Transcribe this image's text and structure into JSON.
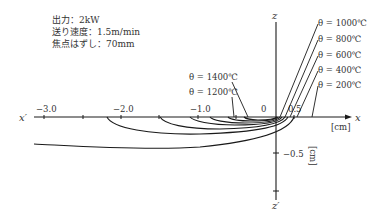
{
  "conditions": {
    "power": "出力：2kW",
    "feed_speed": "送り速度：1.5m/min",
    "defocus": "焦点はずし：70mm"
  },
  "axes": {
    "x_pos_label": "x",
    "x_neg_label": "x′",
    "z_pos_label": "z",
    "z_neg_label": "z′",
    "x_unit": "[cm]",
    "z_unit": "[cm]",
    "x_ticks": [
      "−3.0",
      "−2.0",
      "−1.0",
      "0",
      "0.5"
    ],
    "z_ticks": [
      "−0.5"
    ]
  },
  "isotherms": [
    {
      "label": "θ = 1400℃",
      "theta": 1400
    },
    {
      "label": "θ = 1200℃",
      "theta": 1200
    },
    {
      "label": "θ = 1000℃",
      "theta": 1000
    },
    {
      "label": "θ = 800℃",
      "theta": 800
    },
    {
      "label": "θ = 600℃",
      "theta": 600
    },
    {
      "label": "θ = 400℃",
      "theta": 400
    },
    {
      "label": "θ = 200℃",
      "theta": 200
    }
  ],
  "colors": {
    "line": "#1a1a1a",
    "text": "#333333",
    "background": "#ffffff"
  }
}
